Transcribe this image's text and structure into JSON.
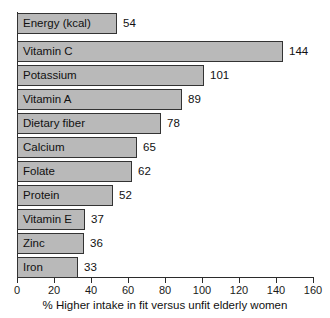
{
  "chart_data": {
    "type": "bar",
    "orientation": "horizontal",
    "title": "",
    "xlabel": "% Higher intake in fit versus unfit elderly women",
    "ylabel": "",
    "xlim": [
      0,
      160
    ],
    "xticks": [
      0,
      20,
      40,
      60,
      80,
      100,
      120,
      140,
      160
    ],
    "xtick_labels": [
      "0",
      "20",
      "40",
      "60",
      "80",
      "100",
      "120",
      "140",
      "160"
    ],
    "grid": false,
    "legend": false,
    "categories": [
      "Energy (kcal)",
      "Vitamin C",
      "Potassium",
      "Vitamin A",
      "Dietary fiber",
      "Calcium",
      "Folate",
      "Protein",
      "Vitamin E",
      "Zinc",
      "Iron"
    ],
    "values": [
      54,
      144,
      101,
      89,
      78,
      65,
      62,
      52,
      37,
      36,
      33
    ],
    "value_labels": [
      "54",
      "144",
      "101",
      "89",
      "78",
      "65",
      "62",
      "52",
      "37",
      "36",
      "33"
    ],
    "bar_fill_color": "#b9b9b9",
    "bar_border_color": "#333333",
    "axis_color": "#2b2b2b",
    "background_color": "#ffffff"
  }
}
